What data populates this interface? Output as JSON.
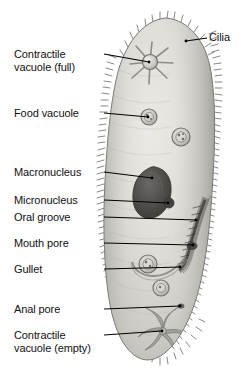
{
  "figure": {
    "colors": {
      "background": "#ffffff",
      "cytoplasm_light": "#e2e1dd",
      "cytoplasm_mid": "#cdccc7",
      "cytoplasm_shadow": "#b0afaa",
      "pellicle_outline": "#6e6d68",
      "cilia": "#3c3b38",
      "macronucleus": "#4c4b47",
      "micronucleus": "#3a3936",
      "vacuole_ring": "#8d8c87",
      "leader_line": "#000000",
      "label_text": "#111111"
    }
  },
  "labels": [
    {
      "id": "cilia",
      "text": "Cilia",
      "side": "right",
      "x": 209,
      "y": 31
    },
    {
      "id": "contractile-vacuole-full",
      "text": "Contractile\nvacuole (full)",
      "side": "left",
      "x": 14,
      "y": 48
    },
    {
      "id": "food-vacuole",
      "text": "Food vacuole",
      "side": "left",
      "x": 14,
      "y": 107
    },
    {
      "id": "macronucleus",
      "text": "Macronucleus",
      "side": "left",
      "x": 14,
      "y": 166
    },
    {
      "id": "micronucleus",
      "text": "Micronucleus",
      "side": "left",
      "x": 14,
      "y": 194
    },
    {
      "id": "oral-groove",
      "text": "Oral groove",
      "side": "left",
      "x": 14,
      "y": 211
    },
    {
      "id": "mouth-pore",
      "text": "Mouth pore",
      "side": "left",
      "x": 14,
      "y": 237
    },
    {
      "id": "gullet",
      "text": "Gullet",
      "side": "left",
      "x": 14,
      "y": 263
    },
    {
      "id": "anal-pore",
      "text": "Anal pore",
      "side": "left",
      "x": 14,
      "y": 303
    },
    {
      "id": "contractile-vacuole-empty",
      "text": "Contractile\nvacuole (empty)",
      "side": "left",
      "x": 14,
      "y": 329
    }
  ],
  "leaders": [
    {
      "id": "leader-cilia",
      "x1": 207,
      "y1": 38,
      "x2": 186,
      "y2": 41
    },
    {
      "id": "leader-contractile-vacuole-full",
      "x1": 104,
      "y1": 54,
      "x2": 149,
      "y2": 62
    },
    {
      "id": "leader-food-vacuole",
      "x1": 104,
      "y1": 113,
      "x2": 148,
      "y2": 117
    },
    {
      "id": "leader-macronucleus",
      "x1": 104,
      "y1": 172,
      "x2": 152,
      "y2": 178
    },
    {
      "id": "leader-micronucleus",
      "x1": 104,
      "y1": 200,
      "x2": 168,
      "y2": 203
    },
    {
      "id": "leader-oral-groove",
      "x1": 104,
      "y1": 217,
      "x2": 196,
      "y2": 220
    },
    {
      "id": "leader-mouth-pore",
      "x1": 104,
      "y1": 243,
      "x2": 193,
      "y2": 245
    },
    {
      "id": "leader-gullet",
      "x1": 104,
      "y1": 269,
      "x2": 180,
      "y2": 267
    },
    {
      "id": "leader-anal-pore",
      "x1": 104,
      "y1": 309,
      "x2": 180,
      "y2": 306
    },
    {
      "id": "leader-contractile-vacuole-empty",
      "x1": 104,
      "y1": 335,
      "x2": 162,
      "y2": 331
    }
  ],
  "structures": [
    {
      "id": "cell-body",
      "kind": "pellicle-outline"
    },
    {
      "id": "cilia-fringe",
      "kind": "hair-fringe"
    },
    {
      "id": "contractile-vacuole-full",
      "kind": "radial-star",
      "cx": 150,
      "cy": 62,
      "r": 23
    },
    {
      "id": "food-vacuole-1",
      "kind": "ring",
      "cx": 149,
      "cy": 117,
      "r": 8
    },
    {
      "id": "food-vacuole-2",
      "kind": "ring",
      "cx": 181,
      "cy": 137,
      "r": 9
    },
    {
      "id": "macronucleus",
      "kind": "kidney-blob",
      "cx": 153,
      "cy": 190
    },
    {
      "id": "micronucleus",
      "kind": "dot",
      "cx": 169,
      "cy": 203,
      "r": 5
    },
    {
      "id": "oral-groove",
      "kind": "groove"
    },
    {
      "id": "mouth-pore",
      "kind": "pore",
      "cx": 192,
      "cy": 246
    },
    {
      "id": "gullet",
      "kind": "gullet-duct"
    },
    {
      "id": "food-vacuole-3",
      "kind": "ring",
      "cx": 148,
      "cy": 264,
      "r": 9
    },
    {
      "id": "food-vacuole-4",
      "kind": "ring",
      "cx": 161,
      "cy": 288,
      "r": 8
    },
    {
      "id": "anal-pore",
      "kind": "dot",
      "cx": 181,
      "cy": 306,
      "r": 3
    },
    {
      "id": "contractile-vacuole-empty",
      "kind": "radial-star",
      "cx": 163,
      "cy": 331,
      "r": 22
    }
  ]
}
